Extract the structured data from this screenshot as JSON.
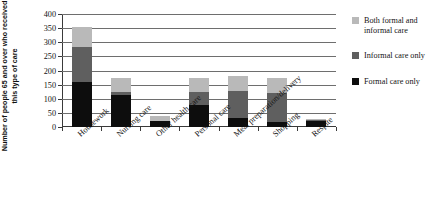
{
  "chart_data": {
    "type": "bar",
    "stacked": true,
    "title": "",
    "xlabel": "",
    "ylabel": "Number of people 65 and over who received this type of care",
    "ylim": [
      0,
      400
    ],
    "yticks": [
      0,
      50,
      100,
      150,
      200,
      250,
      300,
      350,
      400
    ],
    "grid": true,
    "legend_position": "right",
    "categories": [
      "Housework",
      "Nursing care",
      "Other health care",
      "Personal care",
      "Meal preparation/delivery",
      "Shopping",
      "Respite"
    ],
    "series": [
      {
        "name": "Formal care only",
        "color": "#0d0d0d",
        "values": [
          160,
          112,
          20,
          78,
          32,
          18,
          22
        ]
      },
      {
        "name": "Informal care only",
        "color": "#5f5f5f",
        "values": [
          125,
          13,
          3,
          47,
          96,
          102,
          4
        ]
      },
      {
        "name": "Both formal and informal care",
        "color": "#b9b9b9",
        "values": [
          70,
          47,
          15,
          50,
          52,
          52,
          4
        ]
      }
    ],
    "totals": [
      355,
      172,
      38,
      175,
      180,
      172,
      30
    ]
  },
  "legend": {
    "items": [
      {
        "label": "Both formal and informal care",
        "swatch": "both"
      },
      {
        "label": "Informal care only",
        "swatch": "informal"
      },
      {
        "label": "Formal care only",
        "swatch": "formal"
      }
    ]
  }
}
